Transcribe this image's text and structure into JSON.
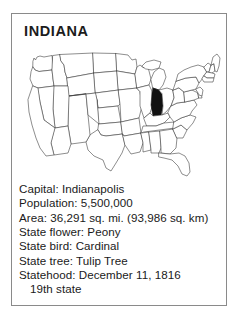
{
  "card": {
    "title": "INDIANA",
    "map": {
      "icon": "us-map-outline",
      "highlighted_state": "Indiana",
      "highlight_color": "#111111",
      "outline_color": "#3a3a3a",
      "fill_color": "#ffffff"
    },
    "facts": [
      {
        "text": "Capital: Indianapolis",
        "name": "fact-capital",
        "indented": false
      },
      {
        "text": "Population: 5,500,000",
        "name": "fact-population",
        "indented": false
      },
      {
        "text": "Area: 36,291 sq. mi. (93,986 sq. km)",
        "name": "fact-area",
        "indented": false
      },
      {
        "text": "State flower: Peony",
        "name": "fact-state-flower",
        "indented": false
      },
      {
        "text": "State bird: Cardinal",
        "name": "fact-state-bird",
        "indented": false
      },
      {
        "text": "State tree: Tulip Tree",
        "name": "fact-state-tree",
        "indented": false
      },
      {
        "text": "Statehood: December 11, 1816",
        "name": "fact-statehood",
        "indented": false
      },
      {
        "text": "19th state",
        "name": "fact-statehood-order",
        "indented": true
      }
    ]
  }
}
